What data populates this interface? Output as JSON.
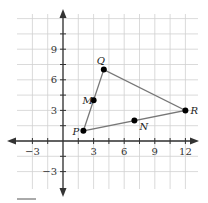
{
  "chart_data": {
    "type": "scatter",
    "title": "",
    "xlabel": "",
    "ylabel": "",
    "xlim": [
      -4.5,
      13.5
    ],
    "ylim": [
      -4.5,
      12
    ],
    "grid": true,
    "grid_step": 1.5,
    "x_tick_labels": [
      "-3",
      "3",
      "6",
      "9",
      "12"
    ],
    "x_tick_values": [
      -3,
      3,
      6,
      9,
      12
    ],
    "y_tick_labels": [
      "-3",
      "3",
      "6",
      "9"
    ],
    "y_tick_values": [
      -3,
      3,
      6,
      9
    ],
    "points": [
      {
        "label": "P",
        "x": 2,
        "y": 1
      },
      {
        "label": "M",
        "x": 3,
        "y": 4
      },
      {
        "label": "Q",
        "x": 4,
        "y": 7
      },
      {
        "label": "R",
        "x": 12,
        "y": 3
      },
      {
        "label": "N",
        "x": 7,
        "y": 2
      }
    ],
    "polygon": [
      "P",
      "Q",
      "R"
    ],
    "legend": "none"
  },
  "colors": {
    "grid": "#d0d0d0",
    "axis": "#333333",
    "edge": "#777777",
    "point": "#000000"
  }
}
